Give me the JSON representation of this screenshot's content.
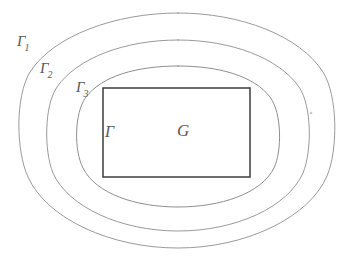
{
  "figure": {
    "type": "math-diagram",
    "background_color": "#ffffff",
    "curve_color": "#9a9a9a",
    "rect_color": "#3c3c3c",
    "label_color": "#5a5a5a"
  },
  "labels": {
    "gamma1": {
      "glyph": "Γ",
      "subscript": "1"
    },
    "gamma2": {
      "glyph": "Γ",
      "subscript": "2"
    },
    "gamma3": {
      "glyph": "Γ",
      "subscript": "3"
    },
    "gamma": {
      "glyph": "Γ",
      "subscript": ""
    },
    "region": {
      "glyph": "G",
      "subscript": ""
    }
  },
  "shapes": {
    "contour_outer": {
      "name": "gamma-1-contour",
      "path": "M 178 13 C 241 13 300 36 323 72 C 338 96 338 150 327 176 C 309 218 245 248 178 248 C 111 248 47 219 28 177 C 16 151 15 97 30 72 C 53 36 115 13 178 13 Z"
    },
    "contour_middle": {
      "name": "gamma-2-contour",
      "path": "M 178 40 C 231 40 279 58 299 87 C 312 106 312 151 303 173 C 288 207 236 231 178 231 C 121 231 68 207 53 173 C 44 151 44 106 57 87 C 77 58 125 40 178 40 Z"
    },
    "contour_inner": {
      "name": "gamma-3-contour",
      "path": "M 178 66 C 219 66 254 76 270 97 C 282 113 282 151 274 168 C 261 194 220 207 178 207 C 136 207 96 194 83 168 C 74 151 74 113 86 97 C 102 76 137 66 178 66 Z"
    },
    "rectangle": {
      "name": "region-g-rectangle",
      "x": 103,
      "y": 88,
      "width": 147,
      "height": 89
    },
    "stray_mark": {
      "name": "stray-pencil-mark",
      "cx": 311,
      "cy": 113,
      "r": 1.3
    }
  }
}
